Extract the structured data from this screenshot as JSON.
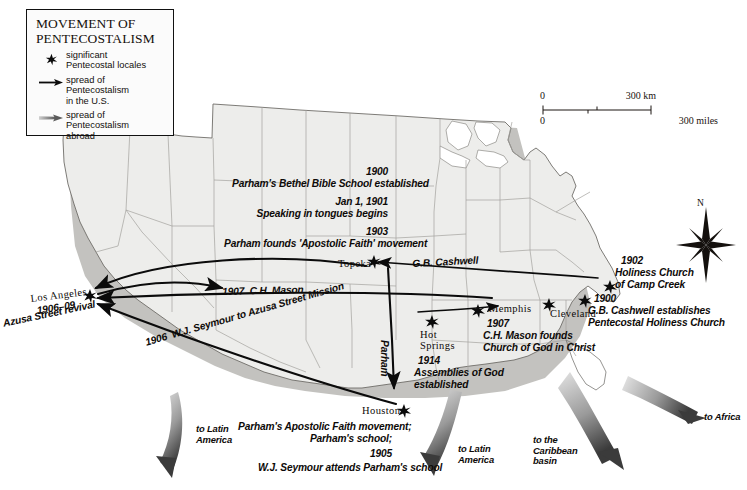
{
  "legend": {
    "title": "MOVEMENT OF\nPENTECOSTALISM",
    "items": [
      {
        "symbol": "star-marker-icon",
        "label": "significant\nPentecostal  locales"
      },
      {
        "symbol": "black-arrow-icon",
        "label": "spread of\nPentecostalism\nin the U.S."
      },
      {
        "symbol": "gray-arrow-icon",
        "label": "spread of\nPentecostalism\nabroad"
      }
    ]
  },
  "scale": {
    "km_zero": "0",
    "km_max": "300 km",
    "miles_zero": "0",
    "miles_max": "300 miles"
  },
  "compass": {
    "north_label": "N"
  },
  "annotations": {
    "topeka_1900_year": "1900",
    "topeka_1900_text": "Parham's Bethel Bible School established",
    "topeka_1901_year": "Jan 1, 1901",
    "topeka_1901_text": "Speaking in tongues begins",
    "topeka_1903_year": "1903",
    "topeka_1903_text": "Parham founds 'Apostolic Faith' movement",
    "topeka_city": "Topeka",
    "los_angeles_city": "Los Angeles",
    "los_angeles_years": "1906–09",
    "los_angeles_text": "Azusa Street revival",
    "mason_route": "1907  C.H. Mason",
    "seymour_route": "1906  W.J. Seymour to Azusa Street Mission",
    "cashwell_route": "G.B. Cashwell",
    "parham_route": "Parham",
    "memphis_city": "Memphis",
    "memphis_year": "1907",
    "memphis_text": "C.H. Mason founds\nChurch of God in Christ",
    "cleveland_city": "Cleveland",
    "hot_springs_city": "Hot\nSprings",
    "hot_springs_year": "1914",
    "hot_springs_text": "Assemblies of God\nestablished",
    "camp_creek_year": "1902",
    "camp_creek_text": "Holiness Church\nof Camp Creek",
    "cashwell_year": "1900",
    "cashwell_text": "G.B. Cashwell establishes\nPentecostal Holiness Church",
    "houston_city": "Houston",
    "houston_text": "Parham's Apostolic Faith movement;\nParham's school;",
    "houston_year": "1905",
    "houston_seymour": "W.J. Seymour attends Parham's school",
    "abroad_latin_west": "to Latin\nAmerica",
    "abroad_latin_gulf": "to Latin\nAmerica",
    "abroad_caribbean": "to the\nCaribbean\nbasin",
    "abroad_africa": "to Africa"
  },
  "colors": {
    "land": "#ededeb",
    "border": "#8d8d8a",
    "coast": "#55534f",
    "shadow": "#b6b5b1",
    "arrow_us": "#0b0b0b",
    "arrow_abroad_dark": "#4a4a4a",
    "arrow_abroad_light": "#dcdcdc",
    "text": "#0d0a08",
    "legend_border": "#111111"
  }
}
